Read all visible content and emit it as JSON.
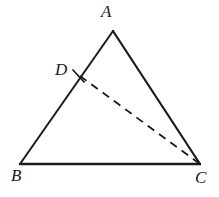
{
  "figure": {
    "kind": "plane-geometry-triangle",
    "background_color": "#ffffff",
    "stroke_color": "#1a1a1a",
    "canvas": {
      "width": 219,
      "height": 197
    }
  },
  "labels": {
    "apex": "A",
    "bottom_left": "B",
    "bottom_right": "C",
    "on_side_ab": "D"
  },
  "points": {
    "A": {
      "x": 113,
      "y": 31
    },
    "B": {
      "x": 20,
      "y": 164
    },
    "C": {
      "x": 200,
      "y": 164
    },
    "D": {
      "x": 80,
      "y": 76
    }
  },
  "segments": [
    {
      "name": "AB",
      "from": "A",
      "to": "B",
      "style": "solid",
      "width": 2.0
    },
    {
      "name": "AC",
      "from": "A",
      "to": "C",
      "style": "solid",
      "width": 2.2
    },
    {
      "name": "BC",
      "from": "B",
      "to": "C",
      "style": "solid",
      "width": 2.4
    },
    {
      "name": "DC",
      "from": "D",
      "to": "C",
      "style": "dashed",
      "width": 1.8,
      "dash_pattern": "8 6"
    }
  ],
  "tick_marks": [
    {
      "name": "d-tick",
      "at": "D",
      "style": "short-perpendicular-stroke",
      "width": 1.8
    }
  ]
}
